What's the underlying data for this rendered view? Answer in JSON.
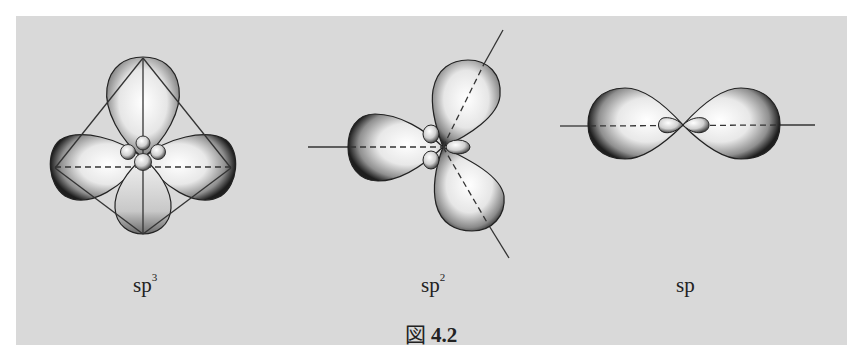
{
  "figure": {
    "caption_prefix": "図",
    "caption_number": "4.2",
    "background_color": "#d9d9d9",
    "panels": [
      {
        "id": "sp3",
        "label_base": "sp",
        "label_sup": "3",
        "orbital_count": 4,
        "geometry": "tetrahedral"
      },
      {
        "id": "sp2",
        "label_base": "sp",
        "label_sup": "2",
        "orbital_count": 3,
        "geometry": "trigonal planar"
      },
      {
        "id": "sp",
        "label_base": "sp",
        "label_sup": "",
        "orbital_count": 2,
        "geometry": "linear"
      }
    ]
  }
}
